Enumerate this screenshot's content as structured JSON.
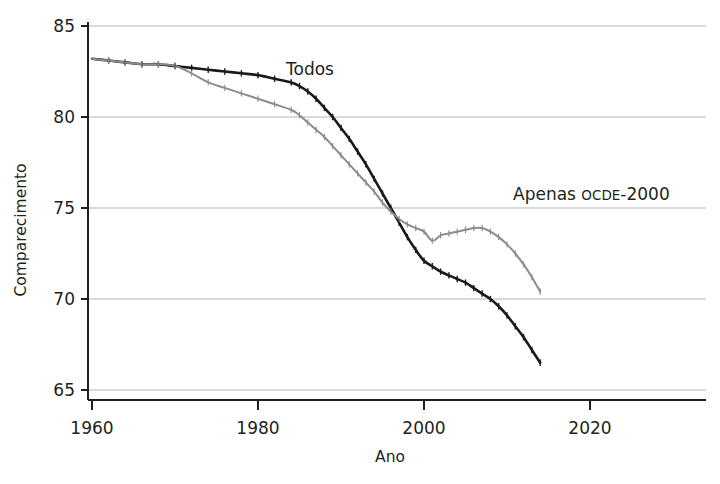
{
  "chart_data": {
    "type": "line",
    "title": "",
    "xlabel": "Ano",
    "ylabel": "Comparecimento",
    "xlim": [
      1960,
      2020
    ],
    "ylim": [
      65,
      85
    ],
    "xticks": [
      1960,
      1980,
      2000,
      2020
    ],
    "yticks": [
      65,
      70,
      75,
      80,
      85
    ],
    "xtick_labels": [
      "1960",
      "1980",
      "2000",
      "2020"
    ],
    "ytick_labels": [
      "65",
      "70",
      "75",
      "80",
      "85"
    ],
    "grid": true,
    "grid_axis": "y",
    "legend_position": "inline-annotations",
    "series": [
      {
        "name": "Todos",
        "color": "#1a1a1a",
        "label_text": "Todos",
        "label_x": 1995,
        "label_y": 82.2,
        "x": [
          1960,
          1962,
          1964,
          1966,
          1968,
          1970,
          1972,
          1974,
          1976,
          1978,
          1980,
          1982,
          1984,
          1985,
          1986,
          1987,
          1988,
          1989,
          1990,
          1991,
          1992,
          1993,
          1994,
          1995,
          1996,
          1997,
          1998,
          1999,
          2000,
          2001,
          2002,
          2003,
          2004,
          2005,
          2006,
          2007,
          2008,
          2009,
          2010,
          2011,
          2012,
          2013,
          2014
        ],
        "y": [
          83.2,
          83.1,
          83.0,
          82.9,
          82.9,
          82.8,
          82.7,
          82.6,
          82.5,
          82.4,
          82.3,
          82.1,
          81.9,
          81.7,
          81.4,
          81.0,
          80.5,
          80.0,
          79.4,
          78.8,
          78.1,
          77.4,
          76.6,
          75.8,
          75.0,
          74.2,
          73.4,
          72.7,
          72.1,
          71.8,
          71.5,
          71.3,
          71.1,
          70.9,
          70.6,
          70.3,
          70.0,
          69.6,
          69.1,
          68.5,
          67.9,
          67.2,
          66.5
        ]
      },
      {
        "name": "Apenas OCDE-2000",
        "color": "#8c8c8c",
        "label_text": "Apenas OCDE-2000",
        "label_x": 2008,
        "label_y": 76.2,
        "x": [
          1960,
          1962,
          1964,
          1966,
          1968,
          1970,
          1972,
          1974,
          1976,
          1978,
          1980,
          1982,
          1984,
          1985,
          1986,
          1987,
          1988,
          1989,
          1990,
          1991,
          1992,
          1993,
          1994,
          1995,
          1996,
          1997,
          1998,
          1999,
          2000,
          2001,
          2002,
          2003,
          2004,
          2005,
          2006,
          2007,
          2008,
          2009,
          2010,
          2011,
          2012,
          2013,
          2014
        ],
        "y": [
          83.2,
          83.1,
          83.0,
          82.9,
          82.9,
          82.8,
          82.4,
          81.9,
          81.6,
          81.3,
          81.0,
          80.7,
          80.4,
          80.1,
          79.7,
          79.3,
          78.9,
          78.4,
          77.9,
          77.4,
          76.9,
          76.4,
          75.9,
          75.3,
          74.8,
          74.4,
          74.1,
          73.9,
          73.7,
          73.2,
          73.5,
          73.6,
          73.7,
          73.8,
          73.9,
          73.9,
          73.7,
          73.4,
          73.0,
          72.5,
          71.9,
          71.2,
          70.4
        ]
      }
    ]
  },
  "axis": {
    "y_title": "Comparecimento",
    "x_title": "Ano"
  },
  "labels": {
    "todos": "Todos",
    "apenas_prefix": "Apenas ",
    "apenas_smallcaps": "OCDE",
    "apenas_suffix": "-2000"
  },
  "colors": {
    "series_all": "#1a1a1a",
    "series_oecd": "#8c8c8c",
    "axis": "#231f20",
    "grid": "#b3b3b3",
    "background": "#ffffff"
  }
}
